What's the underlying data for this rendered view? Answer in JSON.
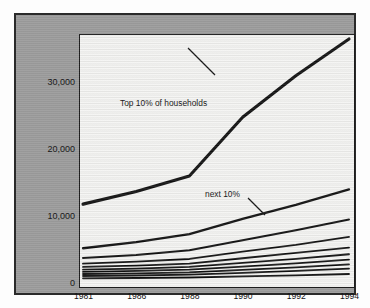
{
  "chart_data": {
    "type": "line",
    "title": "Household Income",
    "subtitle": "baht/month, by decile",
    "source": "Source : Ikamoto",
    "xlabel": "",
    "ylabel": "",
    "categories": [
      "1981",
      "1986",
      "1988",
      "1990",
      "1992",
      "1994"
    ],
    "ylim": [
      0,
      36500
    ],
    "yticks": [
      0,
      10000,
      20000,
      30000
    ],
    "ytick_labels": [
      "0",
      "10,000",
      "20,000",
      "30,000"
    ],
    "grid": false,
    "legend": "none",
    "axis_note": "x categories are evenly spaced (ordinal), not linear in time",
    "series": [
      {
        "name": "Top 10% of households",
        "decile": 10,
        "values": [
          11800,
          13700,
          16000,
          24800,
          31000,
          36500
        ],
        "width": 3.1
      },
      {
        "name": "next 10%",
        "decile": 9,
        "values": [
          5200,
          6100,
          7300,
          9600,
          11700,
          14000
        ],
        "width": 2.3
      },
      {
        "name": "decile 8",
        "decile": 8,
        "values": [
          3750,
          4200,
          4900,
          6400,
          7900,
          9500
        ],
        "width": 2.0
      },
      {
        "name": "decile 7",
        "decile": 7,
        "values": [
          2900,
          3200,
          3600,
          4700,
          5700,
          6900
        ],
        "width": 1.9
      },
      {
        "name": "decile 6",
        "decile": 6,
        "values": [
          2400,
          2600,
          2900,
          3700,
          4500,
          5300
        ],
        "width": 1.8
      },
      {
        "name": "decile 5",
        "decile": 5,
        "values": [
          2000,
          2150,
          2400,
          3000,
          3600,
          4300
        ],
        "width": 1.8
      },
      {
        "name": "decile 4",
        "decile": 4,
        "values": [
          1650,
          1800,
          2000,
          2450,
          2950,
          3500
        ],
        "width": 1.8
      },
      {
        "name": "decile 3",
        "decile": 3,
        "values": [
          1350,
          1450,
          1600,
          1950,
          2350,
          2800
        ],
        "width": 1.8
      },
      {
        "name": "decile 2",
        "decile": 2,
        "values": [
          1050,
          1120,
          1250,
          1500,
          1800,
          2150
        ],
        "width": 1.8
      },
      {
        "name": "decile 1 (lowest)",
        "decile": 1,
        "values": [
          700,
          750,
          820,
          980,
          1150,
          1350
        ],
        "width": 1.8
      }
    ],
    "annotations": [
      {
        "text": "Top 10% of households",
        "x_px": 103,
        "y_px": 82
      },
      {
        "text": "next 10%",
        "x_px": 188,
        "y_px": 173
      }
    ]
  },
  "colors": {
    "panel_background": "#9d9d9d",
    "plot_background": "#f4f4f2",
    "frame": "#2a2a2a",
    "line": "#101010",
    "text": "#121212"
  }
}
